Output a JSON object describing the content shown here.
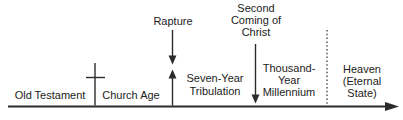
{
  "colors": {
    "line": "#2b2b2b",
    "text": "#1c1c1c",
    "background": "#ffffff"
  },
  "timeline": {
    "type": "horizontal-timeline",
    "direction": "left-to-right",
    "eras": [
      {
        "label": "Old Testament"
      },
      {
        "label": "Church Age"
      },
      {
        "label": "Seven-Year\nTribulation"
      },
      {
        "label": "Thousand-\nYear\nMillennium"
      },
      {
        "label": "Heaven\n(Eternal\nState)"
      }
    ],
    "events": [
      {
        "label": "Rapture",
        "marker": "down-arrow-meeting-up-arrow"
      },
      {
        "label": "Second\nComing of\nChrist",
        "marker": "down-arrow-to-baseline"
      }
    ],
    "icons": [
      {
        "name": "cross-icon",
        "position": "between Old Testament and Church Age"
      },
      {
        "name": "up-arrow-icon",
        "position": "at Rapture point rising from timeline"
      },
      {
        "name": "down-arrow-icon",
        "position": "from Rapture label"
      },
      {
        "name": "down-arrow-icon",
        "position": "from Second Coming of Christ label"
      },
      {
        "name": "dotted-divider",
        "position": "between Millennium and Heaven"
      },
      {
        "name": "right-arrow-icon",
        "position": "end of timeline"
      }
    ]
  }
}
